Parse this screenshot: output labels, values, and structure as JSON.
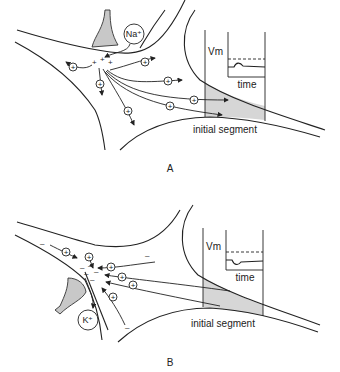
{
  "panels": [
    {
      "id": "A",
      "label": "A",
      "ion": "Na⁺",
      "charge_sign": "+",
      "trace_axis_label": "Vm",
      "trace_time_label": "time",
      "region_label": "initial segment",
      "trace_shape": "depolarizing bump"
    },
    {
      "id": "B",
      "label": "B",
      "ion": "K⁺",
      "charge_sign": "–",
      "trace_axis_label": "Vm",
      "trace_time_label": "time",
      "region_label": "initial segment",
      "trace_shape": "hyperpolarizing dip"
    }
  ],
  "symbols": {
    "positive_ion": "+",
    "negative_charge": "–"
  },
  "colors": {
    "line": "#222222",
    "shading": "#d6d6d6",
    "bouton": "#c8c8c8"
  }
}
